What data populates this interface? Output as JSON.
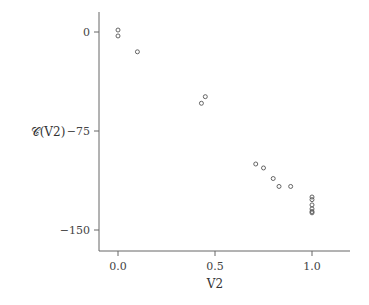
{
  "chart_data": {
    "type": "scatter",
    "title": "",
    "xlabel": "V2",
    "ylabel": "𝒞(V2)",
    "xlim": [
      -0.1,
      1.2
    ],
    "ylim": [
      -166,
      15
    ],
    "xticks": [
      0.0,
      0.5,
      1.0
    ],
    "xtick_labels": [
      "0.0",
      "0.5",
      "1.0"
    ],
    "yticks": [
      0,
      -75,
      -150
    ],
    "ytick_labels": [
      "0",
      "−75",
      "−150"
    ],
    "grid": false,
    "legend": null,
    "marker": "open-circle",
    "points": [
      {
        "x": 0.0,
        "y": 1.5
      },
      {
        "x": 0.0,
        "y": -3
      },
      {
        "x": 0.1,
        "y": -15
      },
      {
        "x": 0.45,
        "y": -49
      },
      {
        "x": 0.43,
        "y": -54
      },
      {
        "x": 0.71,
        "y": -100
      },
      {
        "x": 0.75,
        "y": -103
      },
      {
        "x": 0.8,
        "y": -111
      },
      {
        "x": 0.83,
        "y": -117
      },
      {
        "x": 0.89,
        "y": -117
      },
      {
        "x": 1.0,
        "y": -125
      },
      {
        "x": 1.0,
        "y": -127
      },
      {
        "x": 1.0,
        "y": -131
      },
      {
        "x": 1.0,
        "y": -134
      },
      {
        "x": 1.0,
        "y": -136
      },
      {
        "x": 1.0,
        "y": -137
      }
    ]
  },
  "colors": {
    "axis": "#666666",
    "marker": "#555555",
    "text": "#444444"
  }
}
